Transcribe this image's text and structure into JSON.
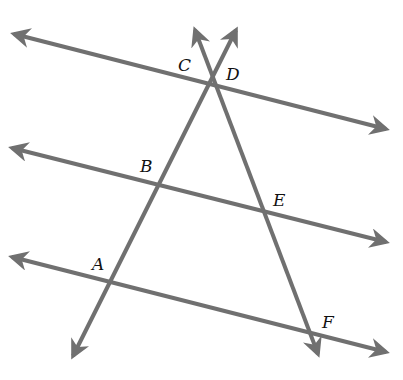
{
  "diagram": {
    "type": "parallel-lines-with-transversals",
    "line_color": "#707070",
    "line_width": 4,
    "label_color": "#111111",
    "parallel_lines": [
      {
        "id": "top",
        "x1": 14,
        "y1": 34,
        "x2": 386,
        "y2": 129
      },
      {
        "id": "middle",
        "x1": 12,
        "y1": 148,
        "x2": 386,
        "y2": 242
      },
      {
        "id": "bottom",
        "x1": 12,
        "y1": 257,
        "x2": 386,
        "y2": 352
      }
    ],
    "transversals": [
      {
        "id": "ABD",
        "x1": 73,
        "y1": 356,
        "x2": 236,
        "y2": 30
      },
      {
        "id": "CEF",
        "x1": 195,
        "y1": 30,
        "x2": 318,
        "y2": 354
      }
    ],
    "points": [
      {
        "label": "C",
        "x": 178,
        "y": 71
      },
      {
        "label": "D",
        "x": 226,
        "y": 80
      },
      {
        "label": "B",
        "x": 140,
        "y": 172
      },
      {
        "label": "E",
        "x": 273,
        "y": 206
      },
      {
        "label": "A",
        "x": 92,
        "y": 270
      },
      {
        "label": "F",
        "x": 322,
        "y": 328
      }
    ]
  }
}
